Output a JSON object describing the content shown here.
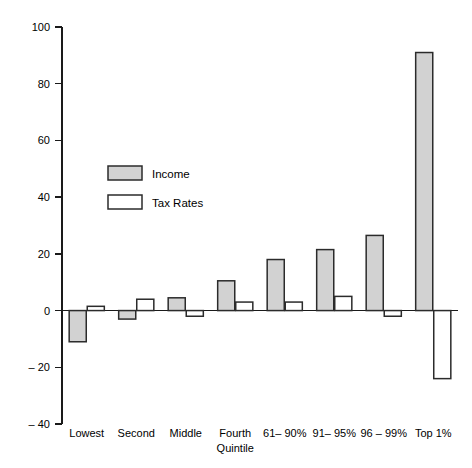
{
  "chart_data": {
    "type": "bar",
    "title": "",
    "subtitle": "",
    "xlabel": "Quintile",
    "ylabel": "",
    "categories": [
      "Lowest",
      "Second",
      "Middle",
      "Fourth",
      "61– 90%",
      "91– 95%",
      "96 – 99%",
      "Top 1%"
    ],
    "series": [
      {
        "name": "Income",
        "values": [
          -11,
          -3,
          4.5,
          10.5,
          18,
          21.5,
          26.5,
          91
        ]
      },
      {
        "name": "Tax Rates",
        "values": [
          1.5,
          4,
          -2,
          3,
          3,
          5,
          -2,
          -24
        ]
      }
    ],
    "ylim": [
      -40,
      100
    ],
    "ytick_step": 20,
    "yticks": [
      "100",
      "80",
      "60",
      "40",
      "20",
      "0",
      "– 20",
      "– 40"
    ],
    "ytick_values": [
      100,
      80,
      60,
      40,
      20,
      0,
      -20,
      -40
    ],
    "grid": false,
    "legend_position": "upper-left-inside",
    "legend": [
      "Income",
      "Tax Rates"
    ],
    "colors": {
      "income_fill": "#d2d2d2",
      "tax_fill": "#ffffff",
      "bar_stroke": "#2b2b2b",
      "axis": "#1a1a1a",
      "background": "#ffffff"
    }
  }
}
